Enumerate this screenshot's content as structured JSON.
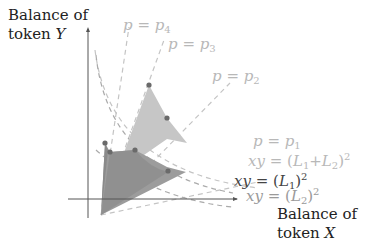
{
  "axes": {
    "y_label_line1": "Balance of",
    "y_label_line2_prefix": "token ",
    "y_label_var": "Y",
    "x_label_line1": "Balance of",
    "x_label_line2_prefix": "token ",
    "x_label_var": "X"
  },
  "price_lines": [
    {
      "p": "p",
      "eq": " = ",
      "sym": "p",
      "sub": "4"
    },
    {
      "p": "p",
      "eq": " = ",
      "sym": "p",
      "sub": "3"
    },
    {
      "p": "p",
      "eq": " = ",
      "sym": "p",
      "sub": "2"
    },
    {
      "p": "p",
      "eq": " = ",
      "sym": "p",
      "sub": "1"
    }
  ],
  "curves": [
    {
      "lhs": "xy",
      "eq": " = (",
      "a": "L",
      "a_sub": "1",
      "plus": "+",
      "b": "L",
      "b_sub": "2",
      "close": ")",
      "exp": "2"
    },
    {
      "lhs": "xy",
      "eq": " = (",
      "a": "L",
      "a_sub": "1",
      "close": ")",
      "exp": "2"
    },
    {
      "lhs": "xy",
      "eq": " = (",
      "a": "L",
      "a_sub": "2",
      "close": ")",
      "exp": "2"
    }
  ],
  "colors": {
    "axis": "#555555",
    "dashes": "#bdbdbd",
    "region_light": "#c4c4c4",
    "region_dark": "#8e8e8e",
    "region_mid": "#a6a6a6",
    "points": "#6a6a6a"
  }
}
